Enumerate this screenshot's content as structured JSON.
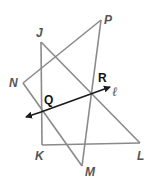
{
  "diagram": {
    "type": "geometry",
    "points": {
      "J": {
        "label": "J",
        "x": 41,
        "y": 42
      },
      "K": {
        "label": "K",
        "x": 42,
        "y": 145
      },
      "L": {
        "label": "L",
        "x": 140,
        "y": 143
      },
      "P": {
        "label": "P",
        "x": 101,
        "y": 20
      },
      "N": {
        "label": "N",
        "x": 23,
        "y": 83
      },
      "M": {
        "label": "M",
        "x": 82,
        "y": 166
      },
      "Q": {
        "label": "Q",
        "x": 41,
        "y": 112
      },
      "R": {
        "label": "R",
        "x": 92,
        "y": 93
      }
    },
    "segments": [
      "JK",
      "KL",
      "JL",
      "NP",
      "NM",
      "PM"
    ],
    "line": {
      "name": "ℓ",
      "through": [
        "Q",
        "R"
      ],
      "arrows": "both"
    },
    "colors": {
      "segment": "#8a8a8a",
      "line": "#1a1a1a",
      "label": "#555555",
      "label_dark": "#111111"
    }
  }
}
